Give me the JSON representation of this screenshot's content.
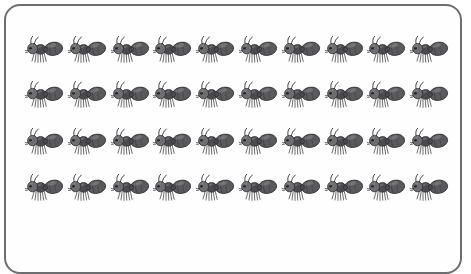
{
  "figure": {
    "kind": "counting-array-illustration",
    "subject_icon": "ant-icon",
    "frame_icon": "rounded-rectangle-border",
    "rows": 4,
    "columns": 10,
    "total_count": 40,
    "caption": "",
    "colors": {
      "background": "#ffffff",
      "panel": "#fefefe",
      "border": "#6d6e70",
      "ant_body_dark": "#4b4b4d",
      "ant_body_mid": "#5a5a5c",
      "ant_body_light": "#6e6e70",
      "ant_highlight": "#8d8d8f",
      "ant_outline": "#2f2f31",
      "ant_eye": "#1d1d1f"
    }
  },
  "chart_data": {
    "type": "table",
    "title": "",
    "xlabel": "",
    "ylabel": "",
    "categories": [
      "Row 1",
      "Row 2",
      "Row 3",
      "Row 4"
    ],
    "values": [
      10,
      10,
      10,
      10
    ],
    "series": [
      {
        "name": "ants per row",
        "values": [
          10,
          10,
          10,
          10
        ]
      }
    ],
    "annotations": [],
    "legend": [],
    "total": 40
  },
  "grid": {
    "rows": [
      {
        "label": "Row 1",
        "count": 10,
        "top": 30,
        "items": [
          {
            "label": "ant"
          },
          {
            "label": "ant"
          },
          {
            "label": "ant"
          },
          {
            "label": "ant"
          },
          {
            "label": "ant"
          },
          {
            "label": "ant"
          },
          {
            "label": "ant"
          },
          {
            "label": "ant"
          },
          {
            "label": "ant"
          },
          {
            "label": "ant"
          }
        ]
      },
      {
        "label": "Row 2",
        "count": 10,
        "top": 75,
        "items": [
          {
            "label": "ant"
          },
          {
            "label": "ant"
          },
          {
            "label": "ant"
          },
          {
            "label": "ant"
          },
          {
            "label": "ant"
          },
          {
            "label": "ant"
          },
          {
            "label": "ant"
          },
          {
            "label": "ant"
          },
          {
            "label": "ant"
          },
          {
            "label": "ant"
          }
        ]
      },
      {
        "label": "Row 3",
        "count": 10,
        "top": 122,
        "items": [
          {
            "label": "ant"
          },
          {
            "label": "ant"
          },
          {
            "label": "ant"
          },
          {
            "label": "ant"
          },
          {
            "label": "ant"
          },
          {
            "label": "ant"
          },
          {
            "label": "ant"
          },
          {
            "label": "ant"
          },
          {
            "label": "ant"
          },
          {
            "label": "ant"
          }
        ]
      },
      {
        "label": "Row 4",
        "count": 10,
        "top": 168,
        "items": [
          {
            "label": "ant"
          },
          {
            "label": "ant"
          },
          {
            "label": "ant"
          },
          {
            "label": "ant"
          },
          {
            "label": "ant"
          },
          {
            "label": "ant"
          },
          {
            "label": "ant"
          },
          {
            "label": "ant"
          },
          {
            "label": "ant"
          },
          {
            "label": "ant"
          }
        ]
      }
    ]
  }
}
